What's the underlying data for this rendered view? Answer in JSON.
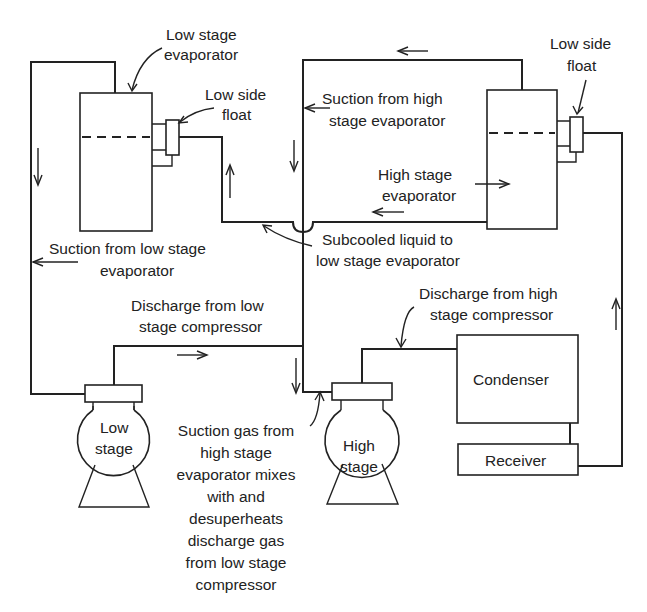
{
  "diagram": {
    "colors": {
      "line": "#222222",
      "background": "#ffffff"
    },
    "components": {
      "low_stage_evaporator": {
        "label_line1": "Low stage",
        "label_line2": "evaporator"
      },
      "low_side_float_left": {
        "label_line1": "Low side",
        "label_line2": "float"
      },
      "low_side_float_right": {
        "label_line1": "Low side",
        "label_line2": "float"
      },
      "high_stage_evaporator": {
        "label_line1": "High stage",
        "label_line2": "evaporator"
      },
      "low_stage_compressor": {
        "label_line1": "Low",
        "label_line2": "stage"
      },
      "high_stage_compressor": {
        "label_line1": "High",
        "label_line2": "stage"
      },
      "condenser": {
        "label": "Condenser"
      },
      "receiver": {
        "label": "Receiver"
      }
    },
    "annotations": {
      "suction_high_stage": {
        "line1": "Suction from high",
        "line2": "stage evaporator"
      },
      "suction_low_stage": {
        "line1": "Suction from low stage",
        "line2": "evaporator"
      },
      "subcooled_liquid": {
        "line1": "Subcooled liquid to",
        "line2": "low stage evaporator"
      },
      "discharge_low_stage": {
        "line1": "Discharge from low",
        "line2": "stage compressor"
      },
      "discharge_high_stage": {
        "line1": "Discharge from high",
        "line2": "stage compressor"
      },
      "suction_gas_mix": {
        "lines": [
          "Suction gas from",
          "high stage",
          "evaporator mixes",
          "with and",
          "desuperheats",
          "discharge gas",
          "from low stage",
          "compressor"
        ]
      }
    }
  }
}
